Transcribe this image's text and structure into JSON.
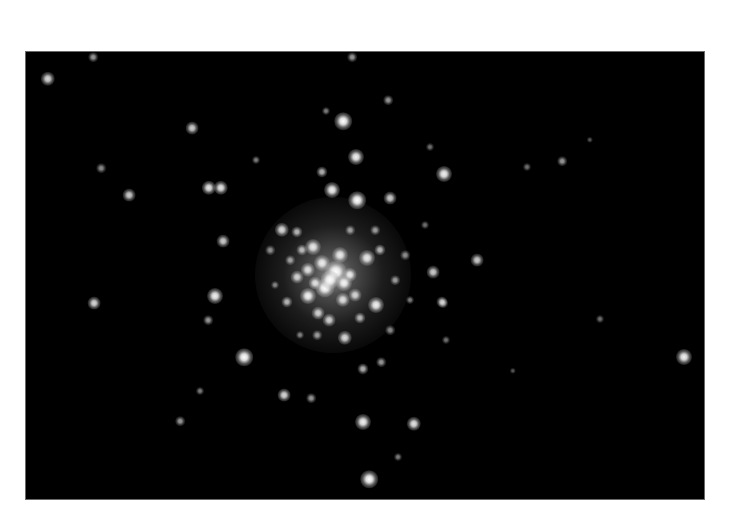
{
  "image": {
    "subject": "globular star cluster",
    "background_color": "#000000",
    "page_color": "#ffffff",
    "frame": {
      "x": 26,
      "y": 52,
      "width": 678,
      "height": 447
    }
  },
  "core": {
    "x": 333,
    "y": 275,
    "radius": 78
  },
  "stars": [
    {
      "x": 48,
      "y": 79,
      "r": 4.5,
      "b": 0.85
    },
    {
      "x": 93,
      "y": 57,
      "r": 3,
      "b": 0.6
    },
    {
      "x": 192,
      "y": 128,
      "r": 4,
      "b": 0.8
    },
    {
      "x": 101,
      "y": 168,
      "r": 3,
      "b": 0.55
    },
    {
      "x": 129,
      "y": 195,
      "r": 4,
      "b": 0.8
    },
    {
      "x": 209,
      "y": 188,
      "r": 4.5,
      "b": 0.9
    },
    {
      "x": 221,
      "y": 188,
      "r": 4.5,
      "b": 0.9
    },
    {
      "x": 256,
      "y": 160,
      "r": 2.5,
      "b": 0.5
    },
    {
      "x": 352,
      "y": 57,
      "r": 3,
      "b": 0.6
    },
    {
      "x": 326,
      "y": 111,
      "r": 2.5,
      "b": 0.5
    },
    {
      "x": 343,
      "y": 121,
      "r": 5.5,
      "b": 1.0
    },
    {
      "x": 388,
      "y": 100,
      "r": 3,
      "b": 0.6
    },
    {
      "x": 356,
      "y": 157,
      "r": 5,
      "b": 0.95
    },
    {
      "x": 322,
      "y": 172,
      "r": 3.5,
      "b": 0.7
    },
    {
      "x": 332,
      "y": 190,
      "r": 5,
      "b": 0.95
    },
    {
      "x": 444,
      "y": 174,
      "r": 5,
      "b": 0.95
    },
    {
      "x": 357,
      "y": 200,
      "r": 5.5,
      "b": 1.0
    },
    {
      "x": 390,
      "y": 198,
      "r": 4,
      "b": 0.8
    },
    {
      "x": 430,
      "y": 147,
      "r": 2.5,
      "b": 0.45
    },
    {
      "x": 562,
      "y": 161,
      "r": 3,
      "b": 0.6
    },
    {
      "x": 590,
      "y": 140,
      "r": 2,
      "b": 0.35
    },
    {
      "x": 527,
      "y": 167,
      "r": 2.5,
      "b": 0.45
    },
    {
      "x": 94,
      "y": 303,
      "r": 4,
      "b": 0.85
    },
    {
      "x": 223,
      "y": 241,
      "r": 4,
      "b": 0.8
    },
    {
      "x": 215,
      "y": 296,
      "r": 5,
      "b": 0.95
    },
    {
      "x": 208,
      "y": 320,
      "r": 3,
      "b": 0.6
    },
    {
      "x": 244,
      "y": 357,
      "r": 5.5,
      "b": 1.0
    },
    {
      "x": 200,
      "y": 391,
      "r": 2.5,
      "b": 0.5
    },
    {
      "x": 180,
      "y": 421,
      "r": 3,
      "b": 0.6
    },
    {
      "x": 284,
      "y": 395,
      "r": 4,
      "b": 0.85
    },
    {
      "x": 311,
      "y": 398,
      "r": 3,
      "b": 0.6
    },
    {
      "x": 363,
      "y": 422,
      "r": 5,
      "b": 0.95
    },
    {
      "x": 369,
      "y": 479,
      "r": 5.5,
      "b": 1.0
    },
    {
      "x": 363,
      "y": 369,
      "r": 3.5,
      "b": 0.7
    },
    {
      "x": 684,
      "y": 357,
      "r": 5,
      "b": 0.95
    },
    {
      "x": 600,
      "y": 319,
      "r": 2.5,
      "b": 0.45
    },
    {
      "x": 414,
      "y": 424,
      "r": 4.5,
      "b": 0.9
    },
    {
      "x": 398,
      "y": 457,
      "r": 2.5,
      "b": 0.5
    },
    {
      "x": 381,
      "y": 362,
      "r": 3,
      "b": 0.6
    },
    {
      "x": 513,
      "y": 371,
      "r": 2,
      "b": 0.35
    },
    {
      "x": 443,
      "y": 303,
      "r": 3,
      "b": 0.55
    },
    {
      "x": 446,
      "y": 340,
      "r": 2.5,
      "b": 0.45
    },
    {
      "x": 477,
      "y": 260,
      "r": 4,
      "b": 0.8
    },
    {
      "x": 433,
      "y": 272,
      "r": 4,
      "b": 0.8
    },
    {
      "x": 442,
      "y": 302,
      "r": 3.5,
      "b": 0.7
    },
    {
      "x": 425,
      "y": 225,
      "r": 2.5,
      "b": 0.45
    },
    {
      "x": 313,
      "y": 247,
      "r": 5,
      "b": 0.9
    },
    {
      "x": 367,
      "y": 258,
      "r": 5,
      "b": 0.9
    },
    {
      "x": 308,
      "y": 296,
      "r": 5,
      "b": 0.95
    },
    {
      "x": 325,
      "y": 288,
      "r": 6,
      "b": 1.0
    },
    {
      "x": 343,
      "y": 300,
      "r": 4.5,
      "b": 0.85
    },
    {
      "x": 376,
      "y": 305,
      "r": 5,
      "b": 0.95
    },
    {
      "x": 297,
      "y": 277,
      "r": 4,
      "b": 0.8
    },
    {
      "x": 287,
      "y": 302,
      "r": 3.5,
      "b": 0.7
    },
    {
      "x": 318,
      "y": 313,
      "r": 4,
      "b": 0.8
    },
    {
      "x": 355,
      "y": 295,
      "r": 4,
      "b": 0.8
    },
    {
      "x": 282,
      "y": 230,
      "r": 4.5,
      "b": 0.85
    },
    {
      "x": 297,
      "y": 232,
      "r": 3.5,
      "b": 0.7
    },
    {
      "x": 340,
      "y": 255,
      "r": 5,
      "b": 0.9
    },
    {
      "x": 322,
      "y": 263,
      "r": 5,
      "b": 0.9
    },
    {
      "x": 350,
      "y": 275,
      "r": 4.5,
      "b": 0.9
    },
    {
      "x": 308,
      "y": 270,
      "r": 4.5,
      "b": 0.85
    },
    {
      "x": 329,
      "y": 320,
      "r": 4,
      "b": 0.8
    },
    {
      "x": 345,
      "y": 338,
      "r": 4.5,
      "b": 0.85
    },
    {
      "x": 380,
      "y": 250,
      "r": 3.5,
      "b": 0.7
    },
    {
      "x": 302,
      "y": 250,
      "r": 3.5,
      "b": 0.7
    },
    {
      "x": 290,
      "y": 260,
      "r": 3,
      "b": 0.6
    },
    {
      "x": 360,
      "y": 318,
      "r": 3.5,
      "b": 0.7
    },
    {
      "x": 317,
      "y": 335,
      "r": 3,
      "b": 0.6
    },
    {
      "x": 336,
      "y": 272,
      "r": 7,
      "b": 1.0
    },
    {
      "x": 330,
      "y": 280,
      "r": 6,
      "b": 1.0
    },
    {
      "x": 344,
      "y": 283,
      "r": 5,
      "b": 0.95
    },
    {
      "x": 315,
      "y": 283,
      "r": 4,
      "b": 0.85
    },
    {
      "x": 395,
      "y": 280,
      "r": 3,
      "b": 0.6
    },
    {
      "x": 405,
      "y": 255,
      "r": 3,
      "b": 0.55
    },
    {
      "x": 270,
      "y": 250,
      "r": 3,
      "b": 0.55
    },
    {
      "x": 275,
      "y": 285,
      "r": 2.5,
      "b": 0.5
    },
    {
      "x": 390,
      "y": 330,
      "r": 3,
      "b": 0.55
    },
    {
      "x": 300,
      "y": 335,
      "r": 2.5,
      "b": 0.5
    },
    {
      "x": 375,
      "y": 230,
      "r": 3,
      "b": 0.6
    },
    {
      "x": 350,
      "y": 230,
      "r": 3,
      "b": 0.6
    },
    {
      "x": 410,
      "y": 300,
      "r": 2.5,
      "b": 0.5
    }
  ]
}
